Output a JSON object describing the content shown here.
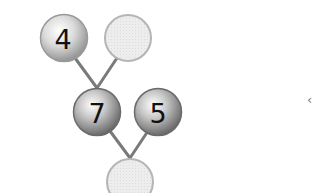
{
  "diagram": {
    "type": "number-bond-tree",
    "nodes": [
      {
        "id": "top-left",
        "value": "4",
        "filled": true
      },
      {
        "id": "top-right",
        "value": "",
        "filled": false
      },
      {
        "id": "middle-left",
        "value": "7",
        "filled": true
      },
      {
        "id": "middle-right",
        "value": "5",
        "filled": true
      },
      {
        "id": "bottom",
        "value": "",
        "filled": false
      }
    ],
    "edges": [
      [
        "top-left",
        "middle-left"
      ],
      [
        "top-right",
        "middle-left"
      ],
      [
        "middle-left",
        "bottom"
      ],
      [
        "middle-right",
        "bottom"
      ]
    ]
  },
  "edge_glyph": "‹",
  "colors": {
    "edge": "#7a7a7a",
    "empty_fill": "#ececec",
    "empty_stroke": "#b5b5b5",
    "ball_light": "#f4f4f4",
    "ball_dark": "#8a8a8a"
  }
}
